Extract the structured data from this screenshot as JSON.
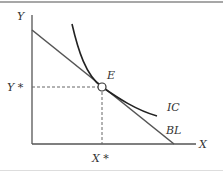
{
  "diagram": {
    "type": "economics-indifference-curve",
    "axes": {
      "x_label": "X",
      "y_label": "Y"
    },
    "equilibrium": {
      "point_label": "E",
      "x_star_label": "X *",
      "y_star_label": "Y *"
    },
    "curves": {
      "indifference_curve_label": "IC",
      "budget_line_label": "BL"
    },
    "colors": {
      "axis": "#555555",
      "budget_line": "#555555",
      "indifference_curve": "#222222",
      "guide": "#666666",
      "border": "#888888"
    }
  }
}
